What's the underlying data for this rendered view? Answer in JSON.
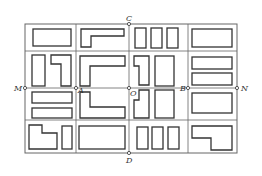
{
  "diagram": {
    "colors": {
      "line": "#555555",
      "block": "#333333",
      "background": "#ffffff"
    },
    "labels": {
      "C": "C",
      "D": "D",
      "M": "M",
      "N": "N",
      "A": "A",
      "B": "B",
      "O": "O"
    },
    "points": [
      {
        "name": "C",
        "x": 129,
        "y": 24
      },
      {
        "name": "D",
        "x": 129,
        "y": 153
      },
      {
        "name": "M",
        "x": 25,
        "y": 88
      },
      {
        "name": "N",
        "x": 237,
        "y": 88
      },
      {
        "name": "A",
        "x": 76,
        "y": 88
      },
      {
        "name": "B",
        "x": 188,
        "y": 88
      },
      {
        "name": "O",
        "x": 129,
        "y": 88
      }
    ],
    "grid": {
      "vertical_lines_x": [
        25,
        76,
        129,
        188,
        237
      ],
      "horizontal_lines_y": [
        24,
        51,
        88,
        120,
        153
      ]
    }
  }
}
